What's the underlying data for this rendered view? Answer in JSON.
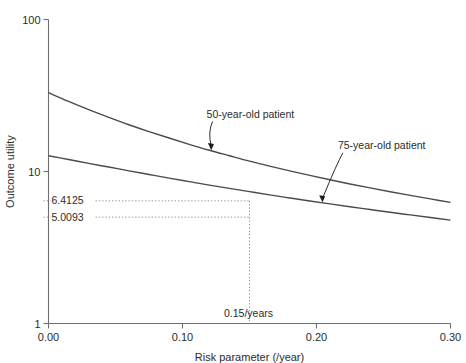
{
  "chart_data": {
    "type": "line",
    "title": "",
    "xlabel": "Risk parameter (/year)",
    "ylabel": "Outcome utility",
    "xlim": [
      0.0,
      0.3
    ],
    "ylim": [
      1,
      100
    ],
    "yscale": "log",
    "xscale": "linear",
    "grid": false,
    "legend_position": "inline-annotations",
    "xticks": [
      "0.00",
      "0.10",
      "0.20",
      "0.30"
    ],
    "xtick_values": [
      0.0,
      0.1,
      0.2,
      0.3
    ],
    "yticks": [
      "1",
      "10",
      "100"
    ],
    "ytick_values": [
      1,
      10,
      100
    ],
    "series": [
      {
        "name": "50-year-old patient",
        "x": [
          0.0,
          0.015,
          0.03,
          0.045,
          0.06,
          0.075,
          0.09,
          0.105,
          0.12,
          0.135,
          0.15,
          0.165,
          0.18,
          0.195,
          0.21,
          0.225,
          0.24,
          0.255,
          0.27,
          0.285,
          0.3
        ],
        "y": [
          33.0,
          28.9,
          25.5,
          22.7,
          20.3,
          18.3,
          16.6,
          15.1,
          13.8,
          12.7,
          11.7,
          10.85,
          10.1,
          9.42,
          8.82,
          8.28,
          7.8,
          7.36,
          6.96,
          6.6,
          6.27
        ]
      },
      {
        "name": "75-year-old patient",
        "x": [
          0.0,
          0.015,
          0.03,
          0.045,
          0.06,
          0.075,
          0.09,
          0.105,
          0.12,
          0.135,
          0.15,
          0.165,
          0.18,
          0.195,
          0.21,
          0.225,
          0.24,
          0.255,
          0.27,
          0.285,
          0.3
        ],
        "y": [
          12.7,
          12.0,
          11.3,
          10.7,
          10.1,
          9.56,
          9.05,
          8.58,
          8.14,
          7.74,
          7.37,
          7.02,
          6.7,
          6.4,
          6.12,
          5.86,
          5.62,
          5.39,
          5.18,
          4.98,
          4.79
        ]
      }
    ],
    "annotations": [
      {
        "name": "series-label-50",
        "text": "50-year-old patient",
        "x": 0.118,
        "y": 22.5
      },
      {
        "name": "series-label-75",
        "text": "75-year-old patient",
        "x": 0.216,
        "y": 14.0
      },
      {
        "name": "value-6-4125",
        "text": "6.4125",
        "x": 0.15,
        "y": 6.4125
      },
      {
        "name": "value-5-0093",
        "text": "5.0093",
        "x": 0.15,
        "y": 5.0093
      },
      {
        "name": "risk-point",
        "text": "0.15/years",
        "x": 0.15,
        "y": 1.0
      }
    ],
    "marked_point": {
      "x_value": 0.15,
      "x_label": "0.15/years",
      "upper_value": "6.4125",
      "lower_value": "5.0093"
    },
    "colors": {
      "curve": "#4a4a4a",
      "axis": "#6e6e6e",
      "guide": "#8a8a8a",
      "text": "#2b2b2b",
      "background": "#ffffff"
    }
  }
}
